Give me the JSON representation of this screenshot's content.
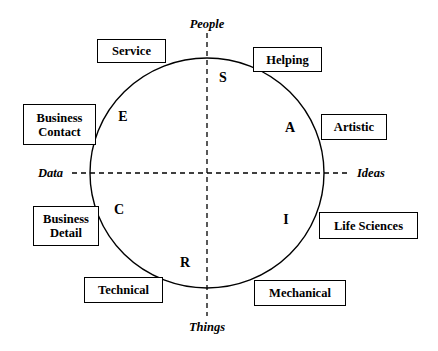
{
  "diagram": {
    "background_color": "#ffffff",
    "line_color": "#000000",
    "circle": {
      "center_x": 207,
      "center_y": 173,
      "radius_x": 117,
      "radius_y": 115
    },
    "axes": {
      "vertical": {
        "top_label": "People",
        "bottom_label": "Things",
        "x": 207,
        "style": "dashed"
      },
      "horizontal": {
        "left_label": "Data",
        "right_label": "Ideas",
        "y": 173,
        "style": "dashed"
      }
    },
    "axis_labels": [
      {
        "id": "people",
        "text": "People",
        "x": 207,
        "y": 24,
        "align": "center"
      },
      {
        "id": "things",
        "text": "Things",
        "x": 207,
        "y": 327,
        "align": "center"
      },
      {
        "id": "data",
        "text": "Data",
        "x": 38,
        "y": 167,
        "align": "left"
      },
      {
        "id": "ideas",
        "text": "Ideas",
        "x": 357,
        "y": 167,
        "align": "left"
      }
    ],
    "riasec_letters": [
      {
        "id": "social",
        "letter": "S",
        "name": "Social",
        "x": 223,
        "y": 78
      },
      {
        "id": "artistic",
        "letter": "A",
        "name": "Artistic",
        "x": 290,
        "y": 128
      },
      {
        "id": "investigative",
        "letter": "I",
        "name": "Investigative",
        "x": 286,
        "y": 220
      },
      {
        "id": "realistic",
        "letter": "R",
        "name": "Realistic",
        "x": 185,
        "y": 263
      },
      {
        "id": "conventional",
        "letter": "C",
        "name": "Conventional",
        "x": 119,
        "y": 210
      },
      {
        "id": "enterprising",
        "letter": "E",
        "name": "Enterprising",
        "x": 123,
        "y": 117
      }
    ],
    "label_boxes": [
      {
        "id": "service",
        "text": "Service",
        "x": 97,
        "y": 39,
        "width": 69,
        "height": 24
      },
      {
        "id": "helping",
        "text": "Helping",
        "x": 253,
        "y": 47,
        "width": 69,
        "height": 25
      },
      {
        "id": "business-contact",
        "text": "Business\nContact",
        "x": 23,
        "y": 104,
        "width": 73,
        "height": 41
      },
      {
        "id": "artistic",
        "text": "Artistic",
        "x": 321,
        "y": 114,
        "width": 66,
        "height": 26
      },
      {
        "id": "business-detail",
        "text": "Business\nDetail",
        "x": 33,
        "y": 206,
        "width": 66,
        "height": 40
      },
      {
        "id": "life-sciences",
        "text": "Life Sciences",
        "x": 319,
        "y": 212,
        "width": 99,
        "height": 27
      },
      {
        "id": "technical",
        "text": "Technical",
        "x": 84,
        "y": 277,
        "width": 79,
        "height": 26
      },
      {
        "id": "mechanical",
        "text": "Mechanical",
        "x": 254,
        "y": 280,
        "width": 92,
        "height": 26
      }
    ]
  }
}
